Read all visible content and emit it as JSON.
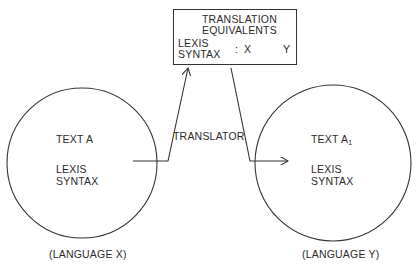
{
  "box": {
    "title_line1": "TRANSLATION",
    "title_line2": "EQUIVALENTS",
    "lexis": "LEXIS",
    "syntax": "SYNTAX",
    "separator": ":",
    "from": "X",
    "to": "Y"
  },
  "translator_label": "TRANSLATOR",
  "left_circle": {
    "text": "TEXT A",
    "lexis": "LEXIS",
    "syntax": "SYNTAX",
    "language": "(LANGUAGE X)"
  },
  "right_circle": {
    "text": "TEXT A",
    "text_subscript": "1",
    "lexis": "LEXIS",
    "syntax": "SYNTAX",
    "language": "(LANGUAGE Y)"
  },
  "colors": {
    "line": "#333333",
    "text": "#2a2a2a"
  }
}
